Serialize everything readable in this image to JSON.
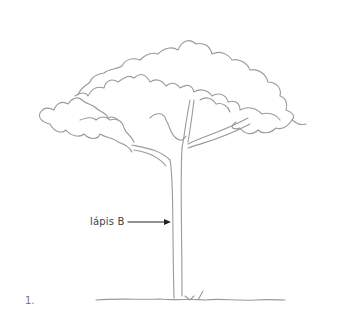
{
  "figure": {
    "annotation_label": "lápis B",
    "figure_number": "1.",
    "stroke_color": "#9a9a9a",
    "text_color": "#444444"
  }
}
